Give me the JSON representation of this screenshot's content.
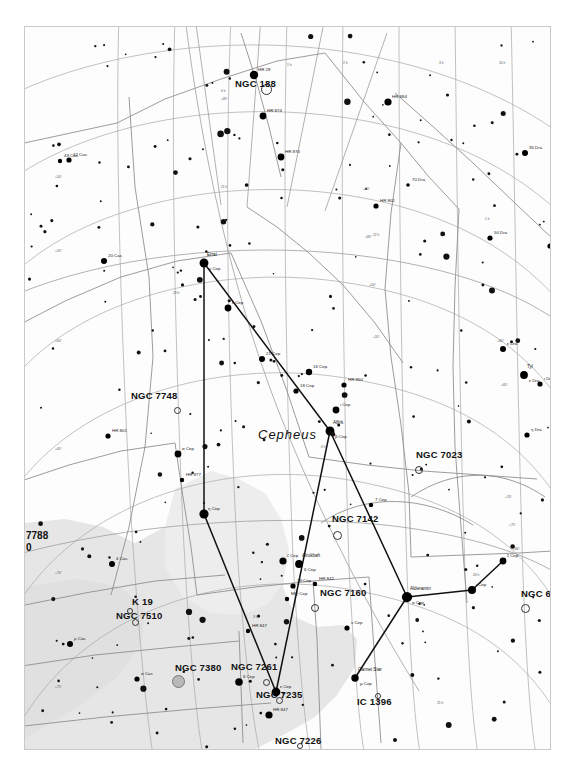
{
  "chart_data": {
    "type": "scatter",
    "constellation": "Cepheus",
    "grid": true,
    "legend": "none",
    "xlabel": "Right Ascension",
    "ylabel": "Declination",
    "ra_ticks": [
      "0 h",
      "1 h",
      "2 h",
      "3 h",
      "20 h",
      "21 h",
      "22 h",
      "23 h"
    ],
    "dec_ticks": [
      "+50°",
      "+55°",
      "+60°",
      "+65°",
      "+70°",
      "+75°",
      "+80°",
      "+85°"
    ],
    "deep_sky_objects": [
      {
        "name": "NGC 188",
        "x": 240,
        "y": 61,
        "mx": 210,
        "my": 60,
        "marker": "open",
        "size": 9
      },
      {
        "name": "NGC 7748",
        "x": 151,
        "y": 382,
        "mx": 106,
        "my": 372,
        "marker": "open",
        "size": 5
      },
      {
        "name": "NGC 7023",
        "x": 393,
        "y": 442,
        "mx": 391,
        "my": 431,
        "marker": "open",
        "size": 6
      },
      {
        "name": "NGC 7142",
        "x": 311,
        "y": 507,
        "mx": 307,
        "my": 495,
        "marker": "open",
        "size": 7
      },
      {
        "name": "NGC 7160",
        "x": 289,
        "y": 580,
        "mx": 295,
        "my": 569,
        "marker": "open",
        "size": 6
      },
      {
        "name": "NGC 6939",
        "x": 499,
        "y": 580,
        "mx": 496,
        "my": 570,
        "marker": "open",
        "size": 7
      },
      {
        "name": "NGC 7510",
        "x": 109,
        "y": 594,
        "mx": 91,
        "my": 592,
        "marker": "open",
        "size": 5
      },
      {
        "name": "K 19",
        "x": 104,
        "y": 583,
        "mx": 107,
        "my": 578,
        "marker": "open",
        "size": 4
      },
      {
        "name": "NGC 7380",
        "x": 152,
        "y": 653,
        "mx": 150,
        "my": 644,
        "marker": "filled",
        "size": 11
      },
      {
        "name": "NGC 7261",
        "x": 240,
        "y": 654,
        "mx": 206,
        "my": 643,
        "marker": "open",
        "size": 5
      },
      {
        "name": "NGC 7235",
        "x": 253,
        "y": 672,
        "mx": 231,
        "my": 671,
        "marker": "open",
        "size": 5
      },
      {
        "name": "NGC 7226",
        "x": 274,
        "y": 718,
        "mx": 250,
        "my": 717,
        "marker": "open",
        "size": 4
      },
      {
        "name": "IC 1396",
        "x": 352,
        "y": 668,
        "mx": 332,
        "my": 678,
        "marker": "open",
        "size": 4
      }
    ],
    "edge_labels": [
      {
        "text": "7788",
        "x": 25,
        "y": 529
      },
      {
        "text": "0",
        "x": 25,
        "y": 541
      }
    ],
    "named_stars": [
      {
        "name": "Errai",
        "bayer": "γ Cep",
        "x": 179,
        "y": 236,
        "mag": 3.2
      },
      {
        "name": "Alfirk",
        "bayer": "β Cep",
        "x": 305,
        "y": 404,
        "mag": 3.2
      },
      {
        "name": "Alderamin",
        "bayer": "α Cep",
        "x": 382,
        "y": 570,
        "mag": 2.5
      },
      {
        "name": "Alrukbah",
        "bayer": "δ Cep",
        "x": 274,
        "y": 537,
        "mag": 3.8
      },
      {
        "name": "Garnet Star",
        "bayer": "μ Cep",
        "x": 330,
        "y": 651,
        "mag": 4.0
      },
      {
        "name": "Tyl",
        "bayer": "ε Dra",
        "x": 499,
        "y": 348,
        "mag": 3.8
      }
    ],
    "stars": [
      {
        "label": "HR 285",
        "x": 229,
        "y": 48,
        "r": 4.2
      },
      {
        "label": "HR 8848",
        "x": 363,
        "y": 75,
        "r": 3.6
      },
      {
        "label": "HR 8748",
        "x": 238,
        "y": 89,
        "r": 3.4
      },
      {
        "label": "HR 8702",
        "x": 256,
        "y": 130,
        "r": 3.4
      },
      {
        "label": "35 Dra",
        "x": 500,
        "y": 126,
        "r": 3.0
      },
      {
        "label": "HR 8015",
        "x": 351,
        "y": 179,
        "r": 2.6
      },
      {
        "label": "70 Dra",
        "x": 383,
        "y": 158,
        "r": 1.8
      },
      {
        "label": "42 Cas",
        "x": 44,
        "y": 133,
        "r": 2.6
      },
      {
        "label": "43 Cas",
        "x": 35,
        "y": 134,
        "r": 2.2
      },
      {
        "label": "50 Dra",
        "x": 465,
        "y": 211,
        "r": 2.6
      },
      {
        "label": "HR 7117",
        "x": 525,
        "y": 219,
        "r": 2.6
      },
      {
        "label": "20 Cas",
        "x": 79,
        "y": 234,
        "r": 3.0
      },
      {
        "label": "ε Cep",
        "x": 203,
        "y": 281,
        "r": 3.4
      },
      {
        "label": "21 Cep",
        "x": 237,
        "y": 332,
        "r": 3.0
      },
      {
        "label": "16 Cep",
        "x": 284,
        "y": 345,
        "r": 3.2
      },
      {
        "label": "18 Cep",
        "x": 271,
        "y": 364,
        "r": 2.6
      },
      {
        "label": "HR 8604",
        "x": 319,
        "y": 358,
        "r": 2.6
      },
      {
        "label": "ι Cep",
        "x": 311,
        "y": 383,
        "r": 3.4
      },
      {
        "label": "HR 8013",
        "x": 83,
        "y": 409,
        "r": 2.6
      },
      {
        "label": "σ Cep",
        "x": 153,
        "y": 427,
        "r": 3.4
      },
      {
        "label": "HR 8779",
        "x": 157,
        "y": 453,
        "r": 2.2
      },
      {
        "label": "η Cep",
        "x": 179,
        "y": 487,
        "r": 4.6
      },
      {
        "label": "7 Cep",
        "x": 346,
        "y": 478,
        "r": 2.2
      },
      {
        "label": "ζ Cep",
        "x": 258,
        "y": 534,
        "r": 3.6
      },
      {
        "label": "ε Dra2",
        "x": 478,
        "y": 322,
        "r": 3.0
      },
      {
        "label": "ι Dra",
        "x": 515,
        "y": 357,
        "r": 2.6
      },
      {
        "label": "η Dra",
        "x": 502,
        "y": 408,
        "r": 2.6
      },
      {
        "label": "ξ Cep",
        "x": 478,
        "y": 534,
        "r": 3.4
      },
      {
        "label": "ι Cep2",
        "x": 447,
        "y": 563,
        "r": 4.0
      },
      {
        "label": "HR 8470",
        "x": 244,
        "y": 688,
        "r": 3.6
      },
      {
        "label": "HR 8475",
        "x": 223,
        "y": 604,
        "r": 2.2
      },
      {
        "label": "ν Cep",
        "x": 322,
        "y": 601,
        "r": 2.6
      },
      {
        "label": "δ Cep",
        "x": 214,
        "y": 655,
        "r": 3.8
      },
      {
        "label": "ε Cep2",
        "x": 251,
        "y": 665,
        "r": 4.4
      },
      {
        "label": "4 Cas",
        "x": 87,
        "y": 537,
        "r": 3.0
      },
      {
        "label": "ρ Cas",
        "x": 45,
        "y": 617,
        "r": 3.0
      },
      {
        "label": "σ Cas",
        "x": 112,
        "y": 652,
        "r": 2.6
      },
      {
        "label": "HR 8427",
        "x": 290,
        "y": 557,
        "r": 2.2
      },
      {
        "label": "19 Cep",
        "x": 268,
        "y": 559,
        "r": 2.6
      },
      {
        "label": "MQ Cep",
        "x": 262,
        "y": 572,
        "r": 2.2
      }
    ],
    "constellation_lines": [
      [
        179,
        236,
        305,
        404
      ],
      [
        179,
        236,
        179,
        487
      ],
      [
        179,
        487,
        251,
        665
      ],
      [
        251,
        665,
        305,
        404
      ],
      [
        305,
        404,
        382,
        570
      ],
      [
        382,
        570,
        447,
        563
      ],
      [
        447,
        563,
        478,
        534
      ],
      [
        382,
        570,
        330,
        651
      ]
    ]
  },
  "axis_labels": {
    "ra": [
      "0 h",
      "1 h",
      "2 h",
      "3 h",
      "20 h",
      "21 h",
      "22 h",
      "23 h"
    ],
    "dec": [
      "+50°",
      "+55°",
      "+60°",
      "+65°",
      "+70°",
      "+75°",
      "+80°",
      "+85°"
    ]
  },
  "colors": {
    "background": "#ffffff",
    "map_background": "#fdfdfd",
    "milky_way": "#e3e3e3",
    "grid": "#9a9a9a",
    "boundary": "#808080",
    "star": "#000000",
    "frame": "#c9c9c9"
  }
}
